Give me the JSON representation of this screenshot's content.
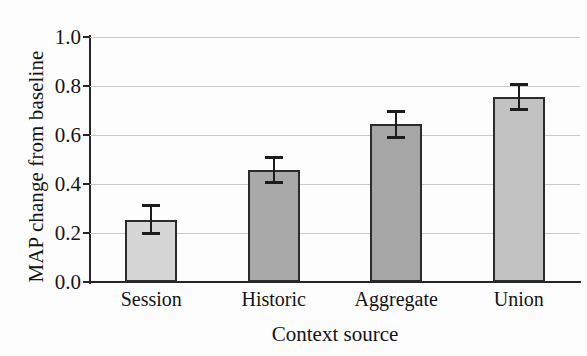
{
  "chart_data": {
    "type": "bar",
    "title": "",
    "xlabel": "Context source",
    "ylabel": "MAP change from baseline",
    "categories": [
      "Session",
      "Historic",
      "Aggregate",
      "Union"
    ],
    "values": [
      0.255,
      0.457,
      0.643,
      0.755
    ],
    "errors": [
      0.063,
      0.058,
      0.058,
      0.058
    ],
    "error_low": [
      0.192,
      0.399,
      0.585,
      0.697
    ],
    "error_high": [
      0.318,
      0.515,
      0.701,
      0.813
    ],
    "ylim": [
      0.0,
      1.0
    ],
    "yticks": [
      0.0,
      0.2,
      0.4,
      0.6,
      0.8,
      1.0
    ],
    "ytick_labels": [
      "0.0",
      "0.2",
      "0.4",
      "0.6",
      "0.8",
      "1.0"
    ],
    "grid": true,
    "grid_axis": "y",
    "legend": false,
    "legend_position": "none",
    "bar_colors": [
      "#d6d6d6",
      "#a9a9a9",
      "#a6a6a6",
      "#c2c2c2"
    ],
    "bar_edge_color": "#2b2b2b",
    "grid_color": "#c9c9c9",
    "axis_color": "#262626",
    "error_color": "#1c1c1c"
  }
}
